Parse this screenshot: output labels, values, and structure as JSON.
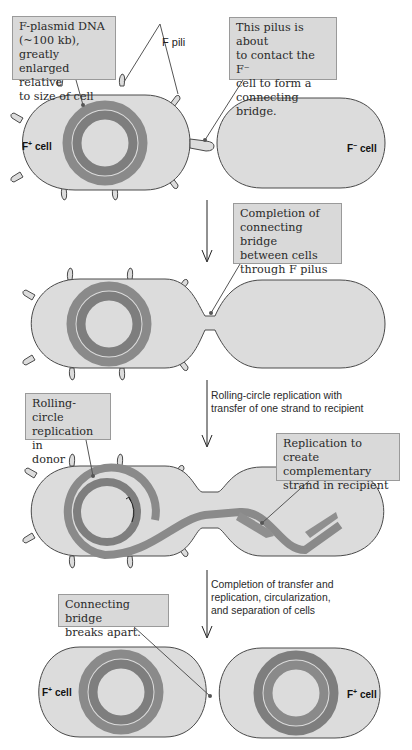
{
  "colors": {
    "cell_fill": "#dcdcdc",
    "cell_stroke": "#4a4a4a",
    "dna_outer": "#8a8a8a",
    "dna_inner": "#7e7e7e",
    "callout_fill": "#d9d9d9",
    "callout_border": "#9a9a9a",
    "leader_line": "#555555"
  },
  "stage1": {
    "callout_fplasmid": "F-plasmid DNA\n(~100 kb), greatly\nenlarged relative\nto size of cell",
    "callout_pilus": "This pilus is about\nto contact the F⁻\ncell to form a\nconnecting bridge.",
    "pili_label": "F pili",
    "donor_label": "F",
    "donor_sup": "+",
    "donor_suffix": " cell",
    "recipient_label": "F",
    "recipient_sup": "−",
    "recipient_suffix": " cell"
  },
  "stage2": {
    "callout_bridge": "Completion of\nconnecting bridge\nbetween cells\nthrough F pilus"
  },
  "step_rolling": "Rolling-circle replication with\ntransfer of one strand to recipient",
  "stage3": {
    "callout_rolling": "Rolling-circle\nreplication in\ndonor",
    "callout_complementary": "Replication to create\ncomplementary\nstrand in recipient"
  },
  "step_completion": "Completion of transfer and\nreplication, circularization,\nand separation of cells",
  "stage4": {
    "callout_breaks": "Connecting bridge\nbreaks apart.",
    "left_label": "F",
    "left_sup": "+",
    "left_suffix": " cell",
    "right_label": "F",
    "right_sup": "+",
    "right_suffix": " cell"
  }
}
